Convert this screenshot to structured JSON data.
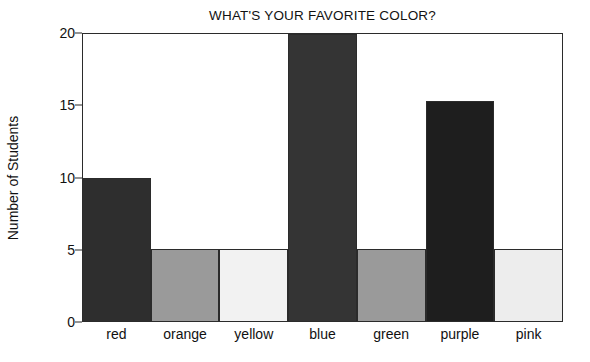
{
  "chart_data": {
    "type": "bar",
    "title": "WHAT'S YOUR FAVORITE COLOR?",
    "xlabel": "",
    "ylabel": "Number of Students",
    "categories": [
      "red",
      "orange",
      "yellow",
      "blue",
      "green",
      "purple",
      "pink"
    ],
    "values": [
      10,
      5,
      5,
      20,
      5,
      15.3,
      5
    ],
    "bar_colors": [
      "#2e2e2e",
      "#9a9a9a",
      "#f2f2f2",
      "#343434",
      "#9a9a9a",
      "#1e1e1e",
      "#ededed"
    ],
    "ylim": [
      0,
      20
    ],
    "yticks": [
      0,
      5,
      10,
      15,
      20
    ],
    "ytick_labels": [
      "0",
      "5",
      "10",
      "15",
      "20"
    ],
    "grid": false,
    "legend": "none",
    "bar_gap": 0,
    "axis_color": "#2b2b2b",
    "background": "#ffffff"
  }
}
